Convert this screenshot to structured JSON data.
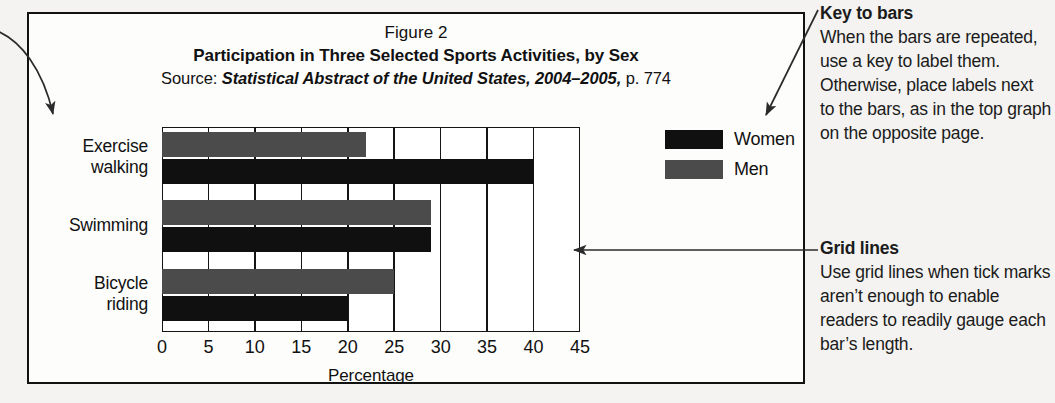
{
  "figure": {
    "number": "Figure 2",
    "title": "Participation in Three Selected Sports Activities, by Sex",
    "source_prefix": "Source: ",
    "source_italic": "Statistical Abstract of the United States, 2004–2005,",
    "source_suffix": " p. 774"
  },
  "legend": {
    "items": [
      {
        "label": "Women",
        "color": "#101010"
      },
      {
        "label": "Men",
        "color": "#4b4b4b"
      }
    ]
  },
  "notes": [
    {
      "id": "key-to-bars",
      "heading": "Key to bars",
      "body": "When the bars are repeated, use a key to label them. Otherwise, place labels next to the bars, as in the top graph on the opposite page."
    },
    {
      "id": "grid-lines",
      "heading": "Grid lines",
      "body": "Use grid lines when tick marks aren’t enough to enable readers to readily gauge each bar’s length."
    }
  ],
  "chart_data": {
    "type": "bar",
    "orientation": "horizontal",
    "title": "Participation in Three Selected Sports Activities, by Sex",
    "xlabel": "Percentage",
    "ylabel": "",
    "xlim": [
      0,
      45
    ],
    "xticks": [
      0,
      5,
      10,
      15,
      20,
      25,
      30,
      35,
      40,
      45
    ],
    "xticklabels": [
      "0",
      "5",
      "10",
      "15",
      "20",
      "25",
      "30",
      "35",
      "40",
      "45"
    ],
    "categories": [
      "Exercise walking",
      "Swimming",
      "Bicycle riding"
    ],
    "category_lines": [
      [
        "Exercise",
        "walking"
      ],
      [
        "Swimming"
      ],
      [
        "Bicycle",
        "riding"
      ]
    ],
    "grid": true,
    "grid_axis": "x",
    "legend_position": "right",
    "series": [
      {
        "name": "Men",
        "color": "#4b4b4b",
        "values": [
          22,
          29,
          25
        ]
      },
      {
        "name": "Women",
        "color": "#101010",
        "values": [
          40,
          29,
          20
        ]
      }
    ]
  }
}
